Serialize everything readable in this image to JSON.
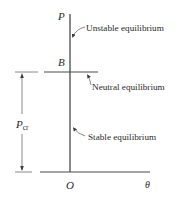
{
  "diagram": {
    "type": "equilibrium-path",
    "axes": {
      "vertical_label": "P",
      "horizontal_label": "θ",
      "origin_label": "O"
    },
    "points": {
      "bifurcation_label": "B"
    },
    "dimension": {
      "label_main": "P",
      "label_sub": "cr"
    },
    "annotations": {
      "unstable": "Unstable equilibrium",
      "neutral": "Neutral equilibrium",
      "stable": "Stable equilibrium"
    },
    "colors": {
      "line": "#4a4a4a",
      "text": "#2a2a2a",
      "background": "#ffffff"
    }
  }
}
